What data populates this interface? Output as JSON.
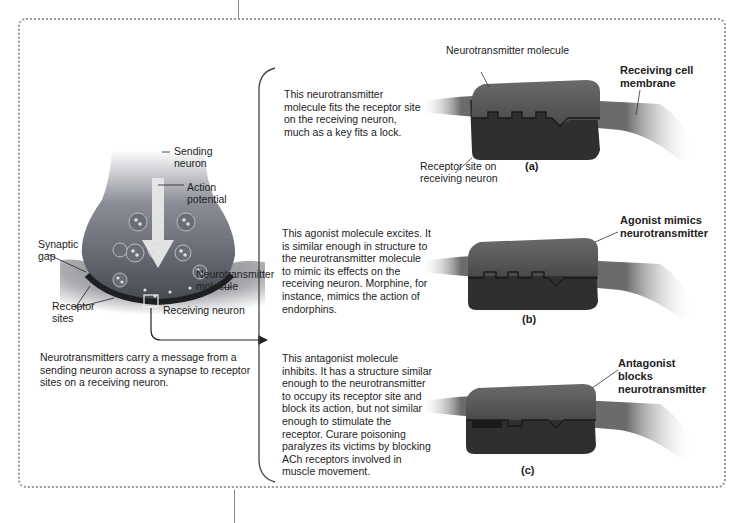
{
  "figure": {
    "colors": {
      "frame_dots": "#9a9a9a",
      "molecule_top": "#5a5a5c",
      "molecule_bottom": "#2e2e30",
      "membrane": "#6b6b6d",
      "neuron_body": "#4a4d55",
      "action_arrow": "#e8e8e8"
    },
    "left_panel": {
      "labels": {
        "sending_neuron": [
          "Sending",
          "neuron"
        ],
        "action_potential": [
          "Action",
          "potential"
        ],
        "synaptic_gap": [
          "Synaptic",
          "gap"
        ],
        "neurotransmitter_molecule": [
          "Neurotransmitter",
          "molecule"
        ],
        "receptor_sites": [
          "Receptor",
          "sites"
        ],
        "receiving_neuron": "Receiving neuron"
      },
      "caption": "Neurotransmitters carry a message from a sending neuron across a synapse to receptor sites on a receiving neuron."
    },
    "panels": [
      {
        "id": "a",
        "caption_letter": "(a)",
        "description": "This neurotransmitter molecule fits the receptor site on the receiving neuron, much as a key fits a lock.",
        "labels": {
          "top": "Neurotransmitter molecule",
          "right": [
            "Receiving cell",
            "membrane"
          ],
          "bottom": [
            "Receptor site on",
            "receiving neuron"
          ]
        }
      },
      {
        "id": "b",
        "caption_letter": "(b)",
        "description": "This agonist molecule excites. It is similar enough  in structure to the neurotransmitter molecule to mimic its effects on the receiving neuron. Morphine, for instance, mimics the action of endorphins.",
        "labels": {
          "right": [
            "Agonist mimics",
            "neurotransmitter"
          ]
        }
      },
      {
        "id": "c",
        "caption_letter": "(c)",
        "description": "This antagonist molecule inhibits. It has a structure similar enough to the neurotransmitter to occupy its receptor site and block its action, but not similar enough to stimulate the receptor. Curare poisoning paralyzes its victims by blocking ACh receptors involved in muscle movement.",
        "labels": {
          "right": [
            "Antagonist",
            "blocks",
            "neurotransmitter"
          ]
        }
      }
    ]
  }
}
